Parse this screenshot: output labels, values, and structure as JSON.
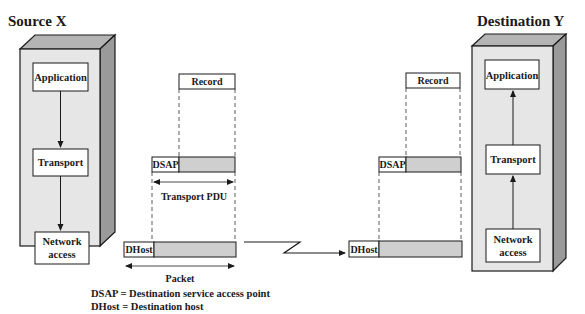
{
  "diagram": {
    "source": {
      "title": "Source X",
      "layers": [
        {
          "label_lines": [
            "Application"
          ]
        },
        {
          "label_lines": [
            "Transport"
          ]
        },
        {
          "label_lines": [
            "Network",
            "access"
          ]
        }
      ],
      "flow_direction": "down"
    },
    "destination": {
      "title": "Destination Y",
      "layers": [
        {
          "label_lines": [
            "Application"
          ]
        },
        {
          "label_lines": [
            "Transport"
          ]
        },
        {
          "label_lines": [
            "Network",
            "access"
          ]
        }
      ],
      "flow_direction": "up"
    },
    "sender_encapsulation": {
      "record_label": "Record",
      "dsap_label": "DSAP",
      "transport_pdu_label": "Transport PDU",
      "dhost_label": "DHost",
      "packet_label": "Packet"
    },
    "receiver_encapsulation": {
      "record_label": "Record",
      "dsap_label": "DSAP",
      "dhost_label": "DHost"
    },
    "legend": [
      {
        "term": "DSAP",
        "definition": "DSAP = Destination service access point"
      },
      {
        "term": "DHost",
        "definition": "DHost = Destination host"
      }
    ]
  },
  "colors": {
    "box_face": "#e8e8e8",
    "box_side": "#9a9a9a",
    "box_top": "#b4b4b4",
    "payload_fill": "#cfcfcf",
    "stroke": "#1a1a1a"
  }
}
